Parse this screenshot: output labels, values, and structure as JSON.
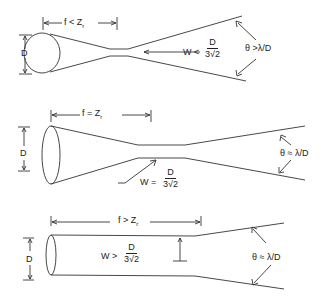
{
  "diagram": {
    "panels": [
      {
        "id": "short_focus",
        "aperture_label": "D",
        "focal_label": "f",
        "focal_relation": "<",
        "focal_ref": "Z",
        "focal_ref_sub": "r",
        "waist_var": "W",
        "waist_relation": "<",
        "waist_num": "D",
        "waist_den": "3√2",
        "angle_label": "θ >λ/D"
      },
      {
        "id": "equal_focus",
        "aperture_label": "D",
        "focal_label": "f",
        "focal_relation": "=",
        "focal_ref": "Z",
        "focal_ref_sub": "r",
        "waist_var": "W",
        "waist_relation": "=",
        "waist_num": "D",
        "waist_den": "3√2",
        "angle_label": "θ ≈ λ/D"
      },
      {
        "id": "long_focus",
        "aperture_label": "D",
        "focal_label": "f",
        "focal_relation": ">",
        "focal_ref": "Z",
        "focal_ref_sub": "r",
        "waist_var": "W",
        "waist_relation": ">",
        "waist_num": "D",
        "waist_den": "3√2",
        "angle_label": "θ ≈ λ/D"
      }
    ],
    "colors": {
      "line": "#333333",
      "background": "#ffffff"
    }
  }
}
